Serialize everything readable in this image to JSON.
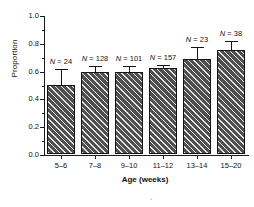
{
  "chart_data": {
    "type": "bar",
    "title": "",
    "xlabel": "Age (weeks)",
    "ylabel": "Proportion",
    "categories": [
      "5–6",
      "7–8",
      "9–10",
      "11–12",
      "13–14",
      "15–20"
    ],
    "values": [
      0.5,
      0.59,
      0.59,
      0.62,
      0.68,
      0.75
    ],
    "errors_upper": [
      0.62,
      0.64,
      0.64,
      0.65,
      0.78,
      0.82
    ],
    "annotations": [
      "N = 24",
      "N = 128",
      "N = 101",
      "N = 157",
      "N = 23",
      "N = 38"
    ],
    "sample_sizes": [
      24,
      128,
      101,
      157,
      23,
      38
    ],
    "ylim": [
      0.0,
      1.0
    ],
    "ytick_labels": [
      "0.0",
      "0.2",
      "0.4",
      "0.6",
      "0.8",
      "1.0"
    ],
    "ytick_values": [
      0.0,
      0.2,
      0.4,
      0.6,
      0.8,
      1.0
    ],
    "yminor_values": [
      0.1,
      0.3,
      0.5,
      0.7,
      0.9
    ],
    "grid": false,
    "legend": false,
    "error_bar_style": "upper-only-with-cap",
    "bar_fill": "diagonal-hatch-dark-gray",
    "colors": {
      "bar_fill": "#4f4f4f",
      "bar_edge": "#141414",
      "axis": "#1a1a1a",
      "text": "#111111",
      "background": "#ffffff"
    }
  },
  "artifact": {
    "mark": "▪"
  }
}
